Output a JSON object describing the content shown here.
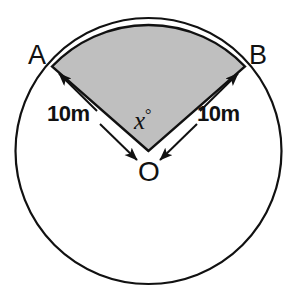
{
  "figure": {
    "type": "circle-sector-diagram",
    "colors": {
      "stroke": "#111111",
      "sector_fill": "#bfbfbf",
      "background": "#ffffff"
    },
    "circle": {
      "center_x": 148.5,
      "center_y": 151,
      "radius": 133,
      "stroke_width": 2.2
    },
    "sector": {
      "apex_x": 148.5,
      "apex_y": 151,
      "start_point_x": 52,
      "start_point_y": 66,
      "end_point_x": 245,
      "end_point_y": 66,
      "fill": "#bfbfbf",
      "stroke_width": 2.2
    },
    "labels": {
      "point_a": "A",
      "point_b": "B",
      "center": "O",
      "angle": "x",
      "angle_degree_symbol": "°",
      "radius_left": "10m",
      "radius_right": "10m"
    },
    "arrows": [
      {
        "name": "arrow-to-a",
        "from_x": 96,
        "from_y": 110,
        "to_x": 57,
        "to_y": 72
      },
      {
        "name": "arrow-to-o-left",
        "from_x": 101,
        "from_y": 125,
        "to_x": 138,
        "to_y": 161
      },
      {
        "name": "arrow-to-b",
        "from_x": 201,
        "from_y": 110,
        "to_x": 240,
        "to_y": 72
      },
      {
        "name": "arrow-to-o-right",
        "from_x": 196,
        "from_y": 125,
        "to_x": 159,
        "to_y": 161
      }
    ]
  }
}
